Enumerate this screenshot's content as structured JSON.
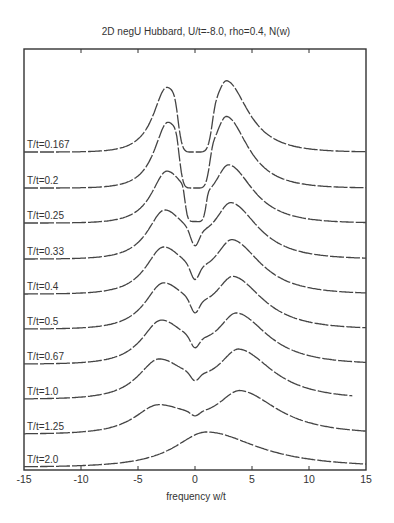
{
  "chart_data": {
    "type": "line",
    "title": "2D negU Hubbard, U/t=-8.0, rho=0.4, N(w)",
    "xlabel": "frequency w/t",
    "ylabel": "",
    "xlim": [
      -15,
      15
    ],
    "xticks": [
      -15,
      -10,
      -5,
      0,
      5,
      10,
      15
    ],
    "xtick_labels": [
      "-15",
      "-10",
      "-5",
      "0",
      "5",
      "10",
      "15"
    ],
    "yticks": [],
    "grid": false,
    "legend": "none (curves labeled inline at left)",
    "layout": "waterfall / vertically offset curves, lowest T at top",
    "series": [
      {
        "name": "T/t=0.167",
        "label": "T/t=0.167",
        "baseline_px": 152,
        "x_end": 15,
        "peaks": [
          {
            "w": -2.5,
            "height": 63,
            "width": 1.6,
            "skew": 3.0
          },
          {
            "w": 2.8,
            "height": 67,
            "width": 1.6,
            "skew": 3.6
          }
        ],
        "gap": {
          "from": -1.5,
          "to": 1.5,
          "depth": 1.0
        }
      },
      {
        "name": "T/t=0.2",
        "label": "T/t=0.2",
        "baseline_px": 188,
        "x_end": 15,
        "peaks": [
          {
            "w": -2.4,
            "height": 64,
            "width": 1.6,
            "skew": 3.0
          },
          {
            "w": 2.8,
            "height": 67,
            "width": 1.6,
            "skew": 3.6
          }
        ],
        "gap": {
          "from": -1.4,
          "to": 1.3,
          "depth": 1.0
        }
      },
      {
        "name": "T/t=0.25",
        "label": "T/t=0.25",
        "baseline_px": 223,
        "x_end": 15,
        "peaks": [
          {
            "w": -2.5,
            "height": 50,
            "width": 1.8,
            "skew": 3.0
          },
          {
            "w": 3.0,
            "height": 54,
            "width": 1.8,
            "skew": 3.6
          }
        ],
        "gap": {
          "from": -0.9,
          "to": 1.0,
          "depth": 0.95
        }
      },
      {
        "name": "T/t=0.33",
        "label": "T/t=0.33",
        "baseline_px": 259,
        "x_end": 15,
        "peaks": [
          {
            "w": -2.7,
            "height": 47,
            "width": 2.0,
            "skew": 3.0
          },
          {
            "w": 3.2,
            "height": 52,
            "width": 2.0,
            "skew": 3.6
          }
        ],
        "gap": {
          "from": -0.5,
          "to": 0.5,
          "depth": 0.55
        }
      },
      {
        "name": "T/t=0.4",
        "label": "T/t=0.4",
        "baseline_px": 294,
        "x_end": 15,
        "peaks": [
          {
            "w": -2.8,
            "height": 45,
            "width": 2.1,
            "skew": 3.0
          },
          {
            "w": 3.3,
            "height": 50,
            "width": 2.1,
            "skew": 3.6
          }
        ],
        "gap": {
          "from": -0.5,
          "to": 0.5,
          "depth": 0.5
        }
      },
      {
        "name": "T/t=0.5",
        "label": "T/t=0.5",
        "baseline_px": 329,
        "x_end": 15,
        "peaks": [
          {
            "w": -2.8,
            "height": 44,
            "width": 2.2,
            "skew": 3.0
          },
          {
            "w": 3.4,
            "height": 48,
            "width": 2.2,
            "skew": 3.6
          }
        ],
        "gap": {
          "from": -0.5,
          "to": 0.5,
          "depth": 0.45
        }
      },
      {
        "name": "T/t=0.67",
        "label": "T/t=0.67",
        "baseline_px": 364,
        "x_end": 15,
        "peaks": [
          {
            "w": -3.0,
            "height": 42,
            "width": 2.3,
            "skew": 3.0
          },
          {
            "w": 3.7,
            "height": 47,
            "width": 2.3,
            "skew": 3.6
          }
        ],
        "gap": {
          "from": -0.5,
          "to": 0.5,
          "depth": 0.4
        }
      },
      {
        "name": "T/t=1.0",
        "label": "T/t=1.0",
        "baseline_px": 399,
        "x_end": 13.8,
        "peaks": [
          {
            "w": -3.2,
            "height": 38,
            "width": 2.5,
            "skew": 3.0
          },
          {
            "w": 3.9,
            "height": 46,
            "width": 2.5,
            "skew": 3.6
          }
        ],
        "gap": {
          "from": -0.5,
          "to": 0.5,
          "depth": 0.3
        }
      },
      {
        "name": "T/t=1.25",
        "label": "T/t=1.25",
        "baseline_px": 434,
        "x_end": 15,
        "peaks": [
          {
            "w": -3.3,
            "height": 27,
            "width": 2.8,
            "skew": 3.0
          },
          {
            "w": 4.0,
            "height": 40,
            "width": 2.8,
            "skew": 3.6
          }
        ],
        "gap": {
          "from": -0.5,
          "to": 0.5,
          "depth": 0.2
        }
      },
      {
        "name": "T/t=2.0",
        "label": "T/t=2.0",
        "baseline_px": 467,
        "x_end": 15,
        "peaks": [
          {
            "w": 1.0,
            "height": 35,
            "width": 3.8,
            "skew": 3.6
          }
        ],
        "gap": null
      }
    ]
  },
  "axes": {
    "box": {
      "left": 24,
      "right": 366,
      "top": 49,
      "bottom": 470
    }
  },
  "text": {
    "title": "2D negU Hubbard, U/t=-8.0, rho=0.4, N(w)",
    "xlabel": "frequency w/t"
  }
}
